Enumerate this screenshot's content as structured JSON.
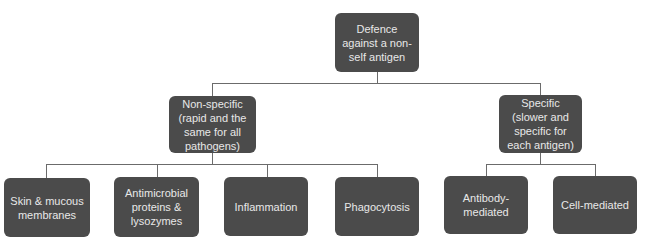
{
  "diagram": {
    "root": {
      "label": "Defence against a non-self antigen"
    },
    "branches": [
      {
        "label": "Non-specific (rapid and the same for all pathogens)",
        "children": [
          {
            "label": "Skin & mucous membranes"
          },
          {
            "label": "Antimicrobial proteins & lysozymes"
          },
          {
            "label": "Inflammation"
          },
          {
            "label": "Phagocytosis"
          }
        ]
      },
      {
        "label": "Specific (slower and specific for each antigen)",
        "children": [
          {
            "label": "Antibody-mediated"
          },
          {
            "label": "Cell-mediated"
          }
        ]
      }
    ]
  },
  "colors": {
    "box_fill": "#4b4b4b",
    "box_text": "#e8e8e8",
    "connector": "#6b6b6b",
    "background": "#ffffff"
  }
}
